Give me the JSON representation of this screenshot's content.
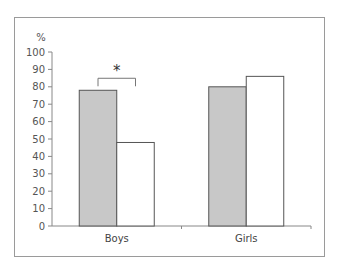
{
  "chart_data": {
    "type": "bar",
    "title": "",
    "xlabel": "",
    "ylabel": "%",
    "ylim": [
      0,
      100
    ],
    "yticks": [
      0,
      10,
      20,
      30,
      40,
      50,
      60,
      70,
      80,
      90,
      100
    ],
    "categories": [
      "Boys",
      "Girls"
    ],
    "series": [
      {
        "name": "Group 1 (grey)",
        "color": "#c8c8c8",
        "values": [
          78,
          80
        ]
      },
      {
        "name": "Group 2 (white)",
        "color": "#ffffff",
        "values": [
          48,
          86
        ]
      }
    ],
    "annotations": [
      {
        "text": "*",
        "type": "significance-bracket",
        "category": "Boys"
      }
    ],
    "grid": false,
    "legend": "none"
  }
}
